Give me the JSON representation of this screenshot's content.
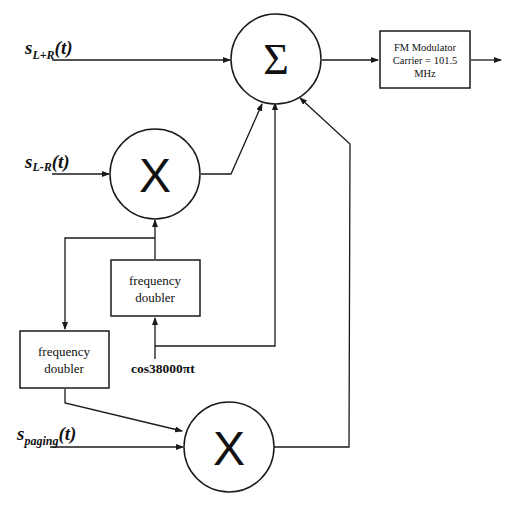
{
  "diagram": {
    "type": "block-diagram",
    "inputs": {
      "s_lpr": {
        "base": "s",
        "sub": "L+R",
        "tail": "(t)"
      },
      "s_lmr": {
        "base": "s",
        "sub": "L-R",
        "tail": "(t)"
      },
      "s_paging": {
        "base": "s",
        "sub": "paging",
        "tail": "(t)"
      },
      "carrier": "cos38000πt"
    },
    "blocks": {
      "summer": {
        "symbol": "Σ",
        "kind": "summing-junction"
      },
      "mixer1": {
        "symbol": "X",
        "kind": "multiplier"
      },
      "mixer2": {
        "symbol": "X",
        "kind": "multiplier"
      },
      "doubler1": {
        "line1": "frequency",
        "line2": "doubler"
      },
      "doubler2": {
        "line1": "frequency",
        "line2": "doubler"
      },
      "fm_modulator": {
        "line1": "FM Modulator",
        "line2": "Carrier = 101.5",
        "line3": "MHz"
      }
    },
    "connections": [
      {
        "from": "s_L+R(t)",
        "to": "summer"
      },
      {
        "from": "s_L-R(t)",
        "to": "mixer1"
      },
      {
        "from": "cos38000πt",
        "to": "doubler1"
      },
      {
        "from": "cos38000πt",
        "to": "summer"
      },
      {
        "from": "doubler1",
        "to": "mixer1"
      },
      {
        "from": "doubler1",
        "to": "doubler2"
      },
      {
        "from": "mixer1",
        "to": "summer"
      },
      {
        "from": "doubler2",
        "to": "mixer2"
      },
      {
        "from": "s_paging(t)",
        "to": "mixer2"
      },
      {
        "from": "mixer2",
        "to": "summer"
      },
      {
        "from": "summer",
        "to": "fm_modulator"
      },
      {
        "from": "fm_modulator",
        "to": "output"
      }
    ]
  }
}
